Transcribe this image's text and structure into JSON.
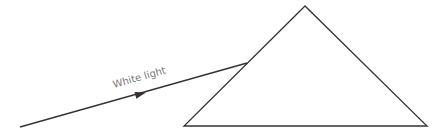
{
  "diagram": {
    "labels": {
      "ray": "White light"
    },
    "colors": {
      "stroke": "#333333",
      "label": "#7a7a7a",
      "background": "#ffffff"
    },
    "shapes": {
      "prism": {
        "type": "triangle",
        "points": [
          [
            305,
            6
          ],
          [
            184,
            126
          ],
          [
            427,
            126
          ]
        ]
      },
      "ray": {
        "type": "arrow-line",
        "from": [
          20,
          127
        ],
        "to": [
          247,
          63
        ],
        "arrow_at": [
          145,
          93
        ]
      }
    }
  }
}
